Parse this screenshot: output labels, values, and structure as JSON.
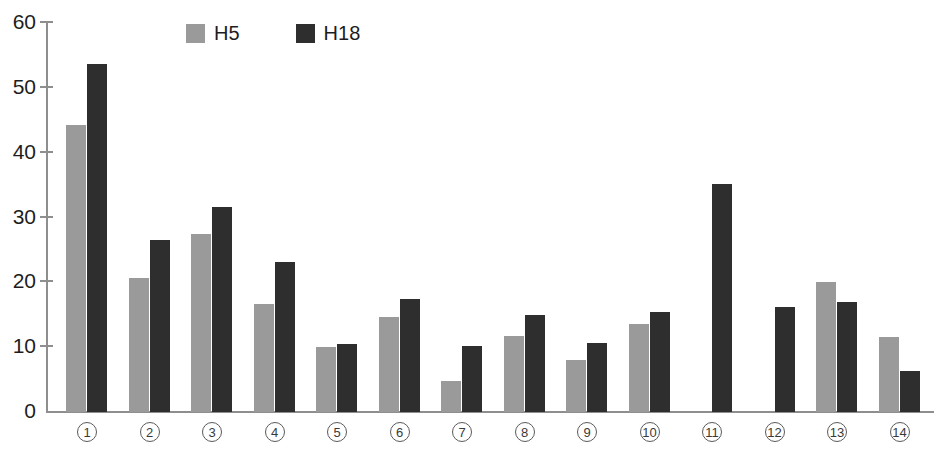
{
  "chart_data": {
    "type": "bar",
    "title": "",
    "subtitle": "",
    "xlabel": "",
    "ylabel": "",
    "ylim": [
      0,
      60
    ],
    "yticks": [
      0,
      10,
      20,
      30,
      40,
      50,
      60
    ],
    "grid": false,
    "legend_position": "top-left",
    "categories": [
      "①",
      "②",
      "③",
      "④",
      "⑤",
      "⑥",
      "⑦",
      "⑧",
      "⑨",
      "⑩",
      "⑪",
      "⑫",
      "⑬",
      "⑭"
    ],
    "category_numbers": [
      1,
      2,
      3,
      4,
      5,
      6,
      7,
      8,
      9,
      10,
      11,
      12,
      13,
      14
    ],
    "series": [
      {
        "name": "H5",
        "color": "#9a9a9a",
        "values": [
          44.3,
          20.7,
          27.5,
          16.6,
          10.0,
          14.6,
          4.8,
          11.8,
          8.0,
          13.6,
          null,
          null,
          20.0,
          11.5
        ]
      },
      {
        "name": "H18",
        "color": "#2e2e2e",
        "values": [
          53.7,
          26.5,
          31.6,
          23.1,
          10.5,
          17.5,
          10.2,
          14.9,
          10.6,
          15.4,
          35.2,
          16.2,
          16.9,
          6.3
        ]
      }
    ]
  },
  "legend": {
    "entries": [
      {
        "label": "H5",
        "color": "#9a9a9a"
      },
      {
        "label": "H18",
        "color": "#2e2e2e"
      }
    ]
  },
  "axis": {
    "y_tick_labels": [
      "60",
      "50",
      "40",
      "30",
      "20",
      "10",
      "0"
    ],
    "y_values": [
      60,
      50,
      40,
      30,
      20,
      10,
      0
    ],
    "axis_color": "#8e8e8e"
  },
  "colors": {
    "background": "#ffffff",
    "h5": "#9a9a9a",
    "h18": "#2e2e2e",
    "axis": "#8e8e8e",
    "text": "#1d1d1d"
  }
}
